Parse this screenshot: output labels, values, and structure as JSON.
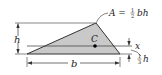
{
  "figure": {
    "type": "triangle-centroid-diagram",
    "colors": {
      "fill": "#c9c9c9",
      "stroke": "#333333",
      "background": "#ffffff"
    },
    "labels": {
      "area_prefix": "A =",
      "area_frac_num": "1",
      "area_frac_den": "2",
      "area_suffix": "bh",
      "height": "h",
      "base": "b",
      "centroid": "C",
      "axis": "x",
      "offset_frac_num": "1",
      "offset_frac_den": "3",
      "offset_suffix": "h"
    }
  }
}
